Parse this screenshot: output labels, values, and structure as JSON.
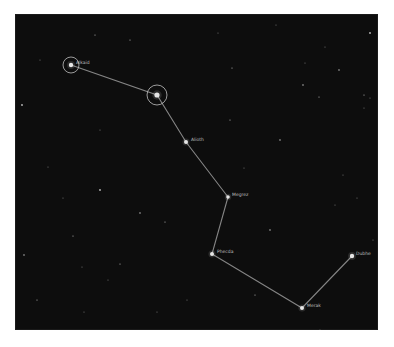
{
  "map": {
    "title": "Big Dipper",
    "background_color": "#0d0d0d",
    "line_color": "#9a9a9a",
    "star_color": "#e6e6e6",
    "ring_color": "#bfbfbf",
    "stars": [
      {
        "name": "Alkaid",
        "x": 71,
        "y": 65,
        "r": 2.2,
        "ring": 8
      },
      {
        "name": "Mizar",
        "x": 157,
        "y": 95,
        "r": 2.6,
        "ring": 10,
        "label": ""
      },
      {
        "name": "Alioth",
        "x": 186,
        "y": 142,
        "r": 2.0
      },
      {
        "name": "Megrez",
        "x": 228,
        "y": 197,
        "r": 1.8
      },
      {
        "name": "Phecda",
        "x": 212,
        "y": 254,
        "r": 2.0
      },
      {
        "name": "Merak",
        "x": 302,
        "y": 308,
        "r": 2.0
      },
      {
        "name": "Dubhe",
        "x": 352,
        "y": 256,
        "r": 2.2
      }
    ],
    "labels": [
      {
        "text": "Alkaid",
        "x": 76,
        "y": 64
      },
      {
        "text": "Alioth",
        "x": 191,
        "y": 141
      },
      {
        "text": "Megrez",
        "x": 232,
        "y": 196
      },
      {
        "text": "Phecda",
        "x": 217,
        "y": 253
      },
      {
        "text": "Merak",
        "x": 307,
        "y": 307
      },
      {
        "text": "Dubhe",
        "x": 356,
        "y": 255
      }
    ],
    "background_stars": [
      [
        22,
        105
      ],
      [
        48,
        167
      ],
      [
        63,
        198
      ],
      [
        73,
        236
      ],
      [
        82,
        267
      ],
      [
        24,
        255
      ],
      [
        37,
        300
      ],
      [
        84,
        312
      ],
      [
        108,
        280
      ],
      [
        120,
        264
      ],
      [
        140,
        213
      ],
      [
        157,
        312
      ],
      [
        165,
        222
      ],
      [
        187,
        300
      ],
      [
        118,
        335
      ],
      [
        100,
        190
      ],
      [
        276,
        25
      ],
      [
        218,
        33
      ],
      [
        232,
        68
      ],
      [
        305,
        63
      ],
      [
        339,
        70
      ],
      [
        364,
        95
      ],
      [
        370,
        98
      ],
      [
        364,
        108
      ],
      [
        319,
        97
      ],
      [
        303,
        85
      ],
      [
        325,
        47
      ],
      [
        230,
        120
      ],
      [
        244,
        168
      ],
      [
        343,
        175
      ],
      [
        370,
        33
      ],
      [
        357,
        198
      ],
      [
        373,
        240
      ],
      [
        255,
        295
      ],
      [
        335,
        205
      ],
      [
        280,
        140
      ],
      [
        130,
        40
      ],
      [
        100,
        130
      ],
      [
        40,
        60
      ],
      [
        95,
        35
      ],
      [
        270,
        230
      ],
      [
        320,
        330
      ]
    ]
  }
}
